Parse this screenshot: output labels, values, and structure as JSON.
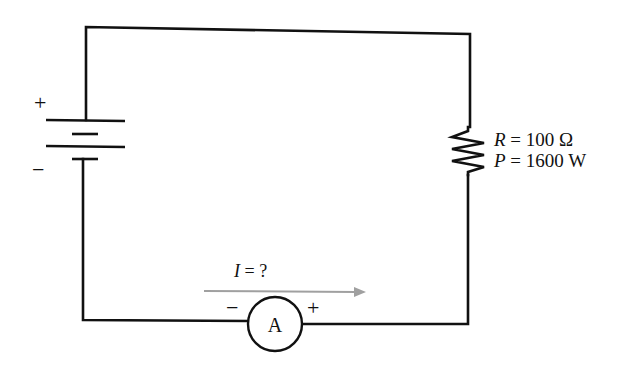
{
  "diagram": {
    "type": "circuit",
    "battery": {
      "plus_label": "+",
      "minus_label": "−"
    },
    "resistor": {
      "r_symbol": "R",
      "r_eq": " = 100 Ω",
      "p_symbol": "P",
      "p_eq": " = 1600 W"
    },
    "current": {
      "symbol": "I",
      "eq": " = ?"
    },
    "ammeter": {
      "label": "A",
      "minus_label": "−",
      "plus_label": "+"
    },
    "colors": {
      "wire": "#111111",
      "arrow": "#a0a0a0",
      "background": "#ffffff"
    }
  }
}
